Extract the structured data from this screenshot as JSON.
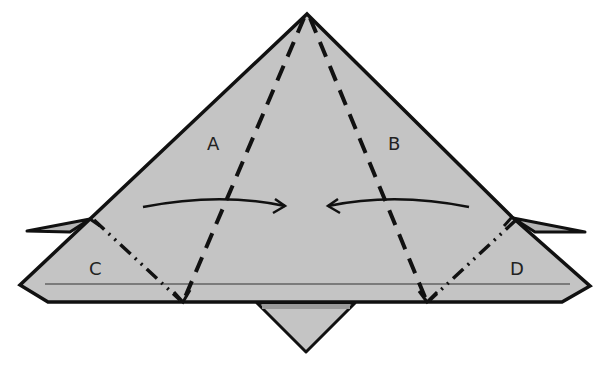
{
  "diagram": {
    "type": "origami-fold-step",
    "colors": {
      "paper": "#c4c4c4",
      "paper_dark": "#9a9a9a",
      "outline": "#111111",
      "background": "#ffffff"
    },
    "labels": {
      "a": "A",
      "b": "B",
      "c": "C",
      "d": "D"
    },
    "fold_lines": {
      "valley_fold": "dashed",
      "mountain_fold": "dash-dot-dot"
    },
    "arrows": [
      {
        "name": "fold-arrow-left-to-center",
        "direction": "right"
      },
      {
        "name": "fold-arrow-right-to-center",
        "direction": "left"
      }
    ]
  }
}
